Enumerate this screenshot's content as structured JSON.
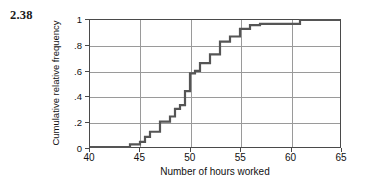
{
  "exercise": {
    "number": "2.38"
  },
  "chart_data": {
    "type": "line",
    "subtype": "step",
    "title": "",
    "xlabel": "Number of hours worked",
    "ylabel": "Cumulative relative frequency",
    "xlim": [
      40,
      65
    ],
    "ylim": [
      0,
      1
    ],
    "grid": true,
    "legend": "none",
    "xticks": [
      40,
      45,
      50,
      55,
      60,
      65
    ],
    "xtick_labels": [
      "40",
      "45",
      "50",
      "55",
      "60",
      "65"
    ],
    "yticks": [
      0,
      0.2,
      0.4,
      0.6,
      0.8,
      1
    ],
    "ytick_labels": [
      "0",
      ".2",
      ".4",
      ".6",
      ".8",
      "1"
    ],
    "series": [
      {
        "name": "Cumulative relative frequency",
        "color": "#555555",
        "x": [
          40,
          43,
          44,
          45,
          45.5,
          46,
          47,
          48,
          48.5,
          49,
          49.5,
          50,
          50.5,
          51,
          52,
          53,
          54,
          55,
          56,
          57,
          61,
          65
        ],
        "y": [
          0,
          0,
          0.02,
          0.04,
          0.08,
          0.12,
          0.2,
          0.24,
          0.3,
          0.33,
          0.44,
          0.58,
          0.6,
          0.66,
          0.73,
          0.83,
          0.87,
          0.93,
          0.96,
          0.97,
          1,
          1
        ]
      }
    ]
  }
}
